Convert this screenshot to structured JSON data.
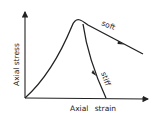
{
  "diagram": {
    "y_axis_label": "Axial stress",
    "x_axis_label": "Axial strain",
    "curves": [
      {
        "name": "soft",
        "label": "soft",
        "description": "gradual post-peak softening"
      },
      {
        "name": "stiff",
        "label": "stiff",
        "description": "steep post-peak drop"
      }
    ],
    "colors": {
      "line": "#222222",
      "background": "#ffffff"
    }
  }
}
